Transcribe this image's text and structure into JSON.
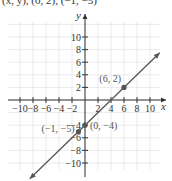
{
  "caption": "(x, y), (0, 2), (−1, −5)",
  "chart_data": {
    "type": "line",
    "title": "",
    "xlabel": "x",
    "ylabel": "y",
    "xlim": [
      -11,
      12
    ],
    "ylim": [
      -12,
      12
    ],
    "grid": true,
    "x_ticks": [
      -10,
      -8,
      -6,
      -4,
      -2,
      2,
      4,
      6,
      8,
      10
    ],
    "x_tick_labels": [
      "−10",
      "−8",
      "−6",
      "−4",
      "−2",
      "2",
      "4",
      "6",
      "8",
      "10"
    ],
    "y_ticks": [
      10,
      8,
      6,
      4,
      2,
      -4,
      -6,
      -8,
      -10
    ],
    "y_tick_labels": [
      "10",
      "8",
      "6",
      "4",
      "2",
      "−4",
      "−6",
      "−8",
      "−10"
    ],
    "series": [
      {
        "name": "line y = x − 4",
        "kind": "line-with-arrows",
        "slope": 1,
        "intercept": -4,
        "color": "#555555"
      }
    ],
    "points": [
      {
        "x": 6,
        "y": 2,
        "label": "(6, 2)"
      },
      {
        "x": 0,
        "y": -4,
        "label": "(0, −4)"
      },
      {
        "x": -1,
        "y": -5,
        "label": "(−1, −5)"
      }
    ]
  },
  "colors": {
    "axis": "#333333",
    "grid": "#e6e6e6",
    "line": "#555555",
    "point": "#555555"
  }
}
